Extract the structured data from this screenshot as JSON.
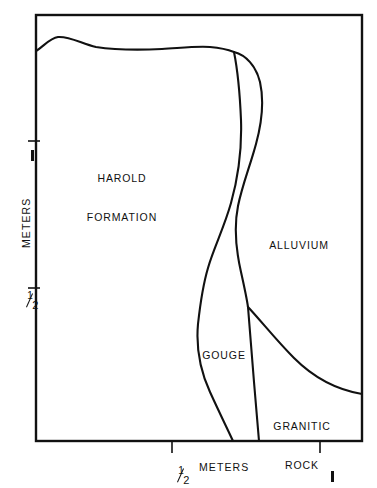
{
  "figure": {
    "type": "geologic-cross-section",
    "background_color": "#ffffff",
    "line_color": "#111111",
    "frame": {
      "left": 36,
      "top": 15,
      "right": 362,
      "bottom": 441
    }
  },
  "axes": {
    "x": {
      "title": "METERS",
      "ticks": [
        {
          "label": "1/2",
          "value": 0.5,
          "pixel_x": 172
        },
        {
          "label": "1",
          "value": 1,
          "pixel_x": 320
        }
      ]
    },
    "y": {
      "title": "METERS",
      "ticks": [
        {
          "label": "1",
          "value": 1,
          "pixel_y": 141
        },
        {
          "label": "1/2",
          "value": 0.5,
          "pixel_y": 288
        }
      ]
    },
    "units": "meters"
  },
  "units_labels": {
    "half_numerator": "1",
    "half_denominator": "2",
    "one": "1"
  },
  "regions": [
    {
      "id": "harold-formation",
      "label_lines": [
        "HAROLD",
        "FORMATION"
      ],
      "label_x": 122,
      "label_y": 155
    },
    {
      "id": "alluvium",
      "label_lines": [
        "ALLUVIUM"
      ],
      "label_x": 299,
      "label_y": 219
    },
    {
      "id": "gouge",
      "label_lines": [
        "GOUGE"
      ],
      "label_x": 224,
      "label_y": 329
    },
    {
      "id": "granitic-rock",
      "label_lines": [
        "GRANITIC",
        "ROCK"
      ],
      "label_x": 302,
      "label_y": 400
    }
  ],
  "chart_data": {
    "type": "line",
    "title": "",
    "xlabel": "METERS",
    "ylabel": "METERS",
    "xlim": [
      0,
      1.1
    ],
    "ylim": [
      0,
      1.45
    ],
    "grid": false,
    "legend": null,
    "xticks": [
      0.5,
      1
    ],
    "xticklabels": [
      "1/2",
      "1"
    ],
    "yticks": [
      0.5,
      1
    ],
    "yticklabels": [
      "1/2",
      "1"
    ],
    "annotations": [
      {
        "text": "HAROLD FORMATION",
        "x": 0.29,
        "y": 0.97
      },
      {
        "text": "ALLUVIUM",
        "x": 0.89,
        "y": 0.75
      },
      {
        "text": "GOUGE",
        "x": 0.63,
        "y": 0.38
      },
      {
        "text": "GRANITIC ROCK",
        "x": 0.9,
        "y": 0.14
      }
    ],
    "series": [
      {
        "name": "ground-surface",
        "description": "Top ground surface from left frame edge to branch junction",
        "path": "M 36 51 C 44 46 50 38 58 37 C 70 36 82 44 96 47 C 116 50 140 50 162 49 C 180 48 196 46 210 47 C 222 48 229 50 234 52"
      },
      {
        "name": "gouge-left-boundary",
        "description": "Contact between Harold Formation and Gouge",
        "path": "M 234 52 C 238 72 240 96 241 120 C 242 150 238 178 231 203 C 224 228 214 247 208 268 C 202 288 200 306 198 324 C 196 346 200 370 210 392 C 220 414 228 430 233 441"
      },
      {
        "name": "gouge-right-boundary",
        "description": "Contact between Gouge and Alluvium / Granitic Rock",
        "path": "M 234 52 C 246 55 256 66 260 82 C 264 100 262 122 256 144 C 250 166 242 186 238 206 C 234 226 236 250 241 272 C 245 290 247 300 248 307 C 250 330 252 356 254 382 C 256 406 258 428 259 441"
      },
      {
        "name": "granitic-rock-contact",
        "description": "Contact between Alluvium and Granitic Rock, from junction to right frame edge",
        "path": "M 248 307 C 262 322 276 340 294 358 C 314 378 338 390 362 394"
      }
    ]
  }
}
